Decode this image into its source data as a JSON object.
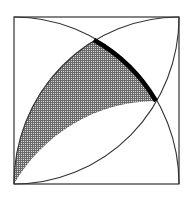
{
  "diagram": {
    "type": "geometry",
    "square": {
      "x": 14,
      "y": 17,
      "width": 165,
      "height": 167
    },
    "arcs": [
      {
        "name": "arc-center-bottom-left",
        "center": "bottom-left",
        "from": "top-left",
        "to": "bottom-right"
      },
      {
        "name": "arc-center-bottom-right",
        "center": "bottom-right",
        "from": "bottom-left",
        "to": "top-right"
      },
      {
        "name": "arc-center-top-left",
        "center": "top-left",
        "from": "bottom-left",
        "to": "top-right"
      }
    ],
    "intersections": {
      "top": {
        "x": 94,
        "y": 40
      },
      "right": {
        "x": 156,
        "y": 101
      }
    },
    "shaded_region": {
      "pattern": "crosshatch",
      "color": "#555555"
    },
    "bold_arc": {
      "from": "top-intersection",
      "to": "right-intersection",
      "color": "#000000"
    },
    "line_color": "#333333",
    "background": "#ffffff"
  }
}
